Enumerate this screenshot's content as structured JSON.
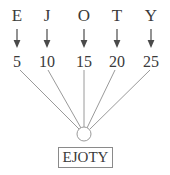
{
  "diagram": {
    "line_color": "#9a9a9a",
    "text_color": "#3a3a3a",
    "box_border_color": "#8a8a8a",
    "background_color": "#ffffff",
    "columns": [
      {
        "letter": "E",
        "arrow": "down-arrow",
        "number": "5",
        "x": 17
      },
      {
        "letter": "J",
        "arrow": "down-arrow",
        "number": "10",
        "x": 47
      },
      {
        "letter": "O",
        "arrow": "down-arrow",
        "number": "15",
        "x": 84
      },
      {
        "letter": "T",
        "arrow": "down-arrow",
        "number": "20",
        "x": 117
      },
      {
        "letter": "Y",
        "arrow": "down-arrow",
        "number": "25",
        "x": 151
      }
    ],
    "junction": {
      "cx": 84,
      "cy": 134,
      "r": 7
    },
    "result_box": {
      "label": "EJOTY",
      "x": 58,
      "y": 147,
      "width": 55,
      "height": 21
    }
  }
}
